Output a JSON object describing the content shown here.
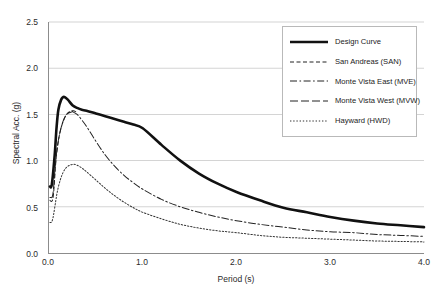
{
  "chart_data": {
    "type": "line",
    "title": "",
    "xlabel": "Period (s)",
    "ylabel": "Spectral Acc. (g)",
    "xlim": [
      0.0,
      4.0
    ],
    "ylim": [
      0.0,
      2.5
    ],
    "xticks": [
      "0.0",
      "1.0",
      "2.0",
      "3.0",
      "4.0"
    ],
    "xtick_values": [
      0.0,
      1.0,
      2.0,
      3.0,
      4.0
    ],
    "yticks": [
      "0.0",
      "0.5",
      "1.0",
      "1.5",
      "2.0",
      "2.5"
    ],
    "ytick_values": [
      0.0,
      0.5,
      1.0,
      1.5,
      2.0,
      2.5
    ],
    "grid": "horizontal",
    "grid_color": "#d4d4d4",
    "axis_color": "#8c8c8c",
    "legend_position": "upper-right",
    "series": [
      {
        "name": "Design Curve",
        "style": "solid",
        "width": 2.6,
        "color": "#111111",
        "x": [
          0.01,
          0.03,
          0.06,
          0.08,
          0.1,
          0.13,
          0.16,
          0.2,
          0.25,
          0.3,
          0.35,
          0.4,
          0.5,
          0.6,
          0.7,
          0.8,
          0.9,
          1.0,
          1.2,
          1.4,
          1.6,
          1.8,
          2.0,
          2.25,
          2.5,
          2.75,
          3.0,
          3.25,
          3.5,
          3.75,
          4.0
        ],
        "y": [
          0.72,
          0.74,
          1.05,
          1.35,
          1.55,
          1.66,
          1.69,
          1.66,
          1.6,
          1.57,
          1.55,
          1.54,
          1.51,
          1.48,
          1.45,
          1.42,
          1.39,
          1.35,
          1.17,
          1.0,
          0.86,
          0.75,
          0.66,
          0.57,
          0.49,
          0.44,
          0.39,
          0.35,
          0.32,
          0.3,
          0.28
        ]
      },
      {
        "name": "San Andreas (SAN)",
        "style": "dashed",
        "width": 1.0,
        "color": "#222222",
        "x": [
          0.01,
          0.02,
          0.03,
          0.04,
          0.05,
          0.06,
          0.07,
          0.08,
          0.1,
          0.12,
          0.15,
          0.18,
          0.22,
          0.26,
          0.3
        ],
        "y": [
          0.57,
          0.56,
          0.56,
          0.58,
          0.66,
          0.8,
          0.95,
          1.06,
          1.21,
          1.32,
          1.42,
          1.49,
          1.53,
          1.54,
          1.52
        ]
      },
      {
        "name": "Monte Vista East (MVE)",
        "style": "dashdot",
        "width": 1.0,
        "color": "#222222",
        "x": [
          0.25,
          0.3,
          0.35,
          0.4,
          0.5,
          0.6,
          0.7,
          0.8,
          0.9,
          1.0,
          1.2,
          1.4,
          1.6,
          1.8,
          2.0,
          2.25,
          2.5,
          2.75,
          3.0,
          3.25,
          3.5,
          3.75,
          4.0
        ],
        "y": [
          1.53,
          1.5,
          1.44,
          1.37,
          1.21,
          1.06,
          0.94,
          0.84,
          0.76,
          0.69,
          0.58,
          0.5,
          0.44,
          0.39,
          0.35,
          0.31,
          0.28,
          0.25,
          0.23,
          0.22,
          0.2,
          0.19,
          0.18
        ]
      },
      {
        "name": "Monte Vista West (MVW)",
        "style": "longdash",
        "width": 1.0,
        "color": "#222222",
        "x": [
          0.01,
          0.02,
          0.03,
          0.04,
          0.05,
          0.06,
          0.08,
          0.1,
          0.13,
          0.16,
          0.2,
          0.25
        ],
        "y": [
          0.6,
          0.6,
          0.6,
          0.63,
          0.72,
          0.86,
          1.08,
          1.22,
          1.36,
          1.45,
          1.51,
          1.53
        ]
      },
      {
        "name": "Hayward (HWD)",
        "style": "dotted",
        "width": 1.0,
        "color": "#333333",
        "x": [
          0.01,
          0.02,
          0.03,
          0.04,
          0.05,
          0.07,
          0.09,
          0.12,
          0.15,
          0.18,
          0.22,
          0.26,
          0.3,
          0.35,
          0.4,
          0.5,
          0.6,
          0.7,
          0.8,
          0.9,
          1.0,
          1.2,
          1.4,
          1.6,
          1.8,
          2.0,
          2.25,
          2.5,
          2.75,
          3.0,
          3.25,
          3.5,
          3.75,
          4.0
        ],
        "y": [
          0.33,
          0.33,
          0.34,
          0.37,
          0.42,
          0.55,
          0.67,
          0.79,
          0.87,
          0.92,
          0.95,
          0.96,
          0.95,
          0.92,
          0.88,
          0.79,
          0.7,
          0.62,
          0.55,
          0.49,
          0.44,
          0.37,
          0.31,
          0.27,
          0.24,
          0.22,
          0.19,
          0.17,
          0.16,
          0.15,
          0.14,
          0.13,
          0.125,
          0.12
        ]
      }
    ]
  },
  "legend": {
    "items": [
      {
        "label": "Design Curve"
      },
      {
        "label": "San Andreas (SAN)"
      },
      {
        "label": "Monte Vista East (MVE)"
      },
      {
        "label": "Monte Vista West (MVW)"
      },
      {
        "label": "Hayward (HWD)"
      }
    ]
  }
}
